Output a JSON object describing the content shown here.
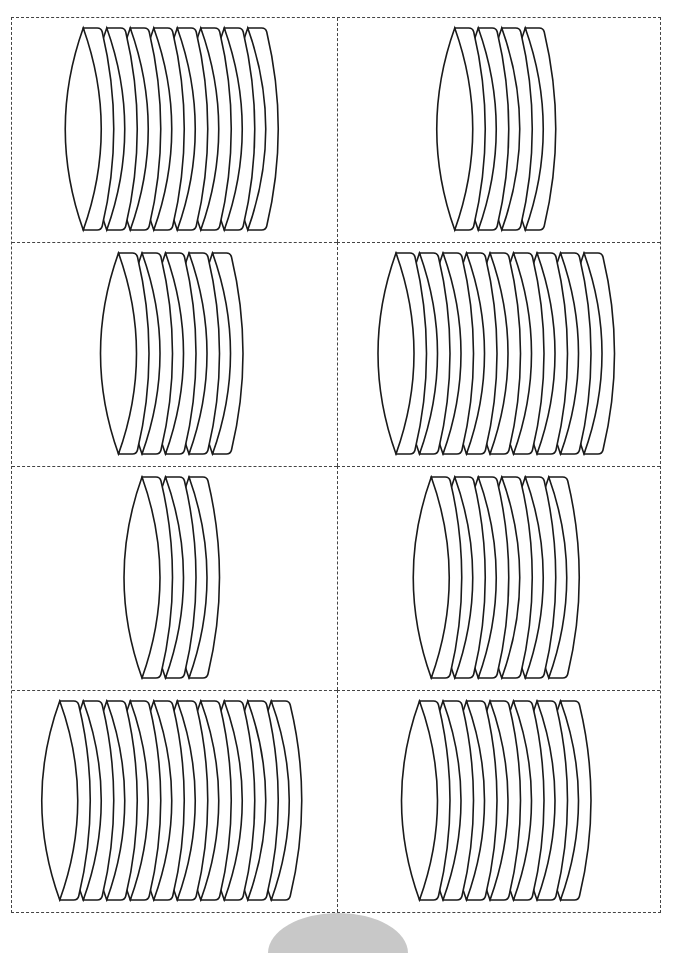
{
  "worksheet": {
    "title": "Counting cookie stacks",
    "layout": {
      "columns": 2,
      "rows": 4
    },
    "stroke_color": "#1a1a1a",
    "border_color": "#444444",
    "cells": [
      {
        "row": 1,
        "col": 1,
        "count": 8,
        "label": "Stack of 8 discs"
      },
      {
        "row": 1,
        "col": 2,
        "count": 4,
        "label": "Stack of 4 discs"
      },
      {
        "row": 2,
        "col": 1,
        "count": 5,
        "label": "Stack of 5 discs"
      },
      {
        "row": 2,
        "col": 2,
        "count": 9,
        "label": "Stack of 9 discs"
      },
      {
        "row": 3,
        "col": 1,
        "count": 3,
        "label": "Stack of 3 discs"
      },
      {
        "row": 3,
        "col": 2,
        "count": 6,
        "label": "Stack of 6 discs"
      },
      {
        "row": 4,
        "col": 1,
        "count": 10,
        "label": "Stack of 10 discs"
      },
      {
        "row": 4,
        "col": 2,
        "count": 7,
        "label": "Stack of 7 discs"
      }
    ]
  }
}
